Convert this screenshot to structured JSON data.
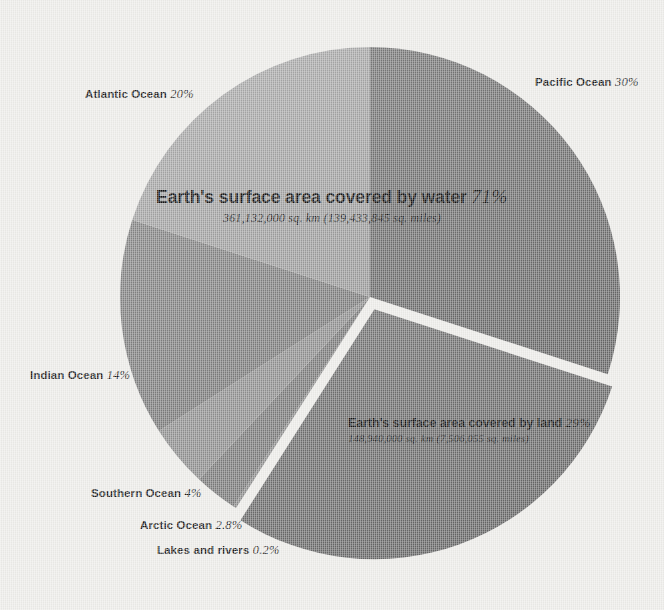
{
  "background": {
    "color": "#edece9",
    "gap_color": "#eceae6"
  },
  "chart_data": {
    "type": "pie",
    "title": "Earth's surface area covered by water",
    "center": [
      370,
      297
    ],
    "radius": 250,
    "start_angle_deg": 0,
    "direction": "clockwise",
    "legend": "callout-labels",
    "categories": [
      "Pacific Ocean",
      "Earth's surface area covered by land",
      "Lakes and rivers",
      "Arctic Ocean",
      "Southern Ocean",
      "Indian Ocean",
      "Atlantic Ocean"
    ],
    "values": [
      30,
      29,
      0.2,
      2.8,
      4,
      14,
      20
    ],
    "colors": [
      "#6f6f6f",
      "#6b6b6b",
      "#8a8a8a",
      "#797979",
      "#8d8d8d",
      "#7d7d7d",
      "#a2a2a2"
    ],
    "slices": [
      {
        "name": "Pacific Ocean",
        "value": 30,
        "label": "Pacific Ocean",
        "pct": "30%",
        "color": "#6f6f6f",
        "exploded": false
      },
      {
        "name": "Land",
        "value": 29,
        "label": "Earth's surface area covered by land",
        "pct": "29%",
        "color": "#6b6b6b",
        "exploded": true
      },
      {
        "name": "Lakes and rivers",
        "value": 0.2,
        "label": "Lakes and rivers",
        "pct": "0.2%",
        "color": "#8a8a8a",
        "exploded": false
      },
      {
        "name": "Arctic Ocean",
        "value": 2.8,
        "label": "Arctic Ocean",
        "pct": "2.8%",
        "color": "#797979",
        "exploded": false
      },
      {
        "name": "Southern Ocean",
        "value": 4,
        "label": "Southern Ocean",
        "pct": "4%",
        "color": "#8d8d8d",
        "exploded": false
      },
      {
        "name": "Indian Ocean",
        "value": 14,
        "label": "Indian Ocean",
        "pct": "14%",
        "color": "#7d7d7d",
        "exploded": false
      },
      {
        "name": "Atlantic Ocean",
        "value": 20,
        "label": "Atlantic Ocean",
        "pct": "20%",
        "color": "#a2a2a2",
        "exploded": false
      }
    ],
    "annotations": [
      {
        "id": "water",
        "head": "Earth's surface area covered by water",
        "pct": "71%",
        "sub": "361,132,000 sq. km (139,433,845 sq. miles)"
      },
      {
        "id": "land",
        "head": "Earth's surface area covered by land",
        "pct": "29%",
        "sub": "148,940,000 sq. km (7,506,055 sq. miles)"
      }
    ]
  },
  "labels": {
    "pacific": {
      "name": "Pacific Ocean",
      "pct": "30%"
    },
    "atlantic": {
      "name": "Atlantic Ocean",
      "pct": "20%"
    },
    "indian": {
      "name": "Indian Ocean",
      "pct": "14%"
    },
    "southern": {
      "name": "Southern Ocean",
      "pct": "4%"
    },
    "arctic": {
      "name": "Arctic Ocean",
      "pct": "2.8%"
    },
    "lakes": {
      "name": "Lakes and rivers",
      "pct": "0.2%"
    }
  },
  "callouts": {
    "water": {
      "head": "Earth's surface area covered by water",
      "pct": "71%",
      "sub": "361,132,000 sq. km (139,433,845 sq. miles)"
    },
    "land": {
      "head": "Earth's surface area covered by land",
      "pct": "29%",
      "sub": "148,940,000 sq. km (7,506,055 sq. miles)"
    }
  }
}
